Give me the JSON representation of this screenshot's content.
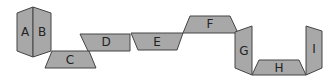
{
  "diagram": {
    "type": "net-of-faces",
    "fill_color": "#a8a8a8",
    "stroke_color": "#444444",
    "faces": [
      {
        "label": "A",
        "points": "17,13 33,7 33,57 17,51",
        "lx": 25,
        "ly": 32
      },
      {
        "label": "B",
        "points": "33,7 51,13 51,51 33,57",
        "lx": 42,
        "ly": 32
      },
      {
        "label": "C",
        "points": "52,51 89,51 96,68 45,68",
        "lx": 70,
        "ly": 60
      },
      {
        "label": "D",
        "points": "80,34 130,34 130,51 88,51",
        "lx": 106,
        "ly": 42
      },
      {
        "label": "E",
        "points": "131,33 183,33 177,50 138,50",
        "lx": 157,
        "ly": 42
      },
      {
        "label": "F",
        "points": "190,16 230,16 238,33 183,33",
        "lx": 210,
        "ly": 24
      },
      {
        "label": "G",
        "points": "235,32 252,26 252,75 235,68",
        "lx": 244,
        "ly": 51
      },
      {
        "label": "H",
        "points": "259,60 299,60 306,75 252,75",
        "lx": 279,
        "ly": 68
      },
      {
        "label": "I",
        "points": "306,26 322,31 322,68 306,75",
        "lx": 314,
        "ly": 49
      }
    ]
  }
}
